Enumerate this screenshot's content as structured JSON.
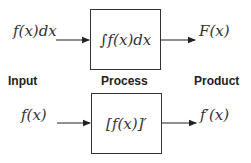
{
  "diagram": {
    "labels": {
      "input": "Input",
      "process": "Process",
      "product": "Product"
    },
    "rows": [
      {
        "input": "f(x)dx",
        "process": "∫f(x)dx",
        "product": "F(x)"
      },
      {
        "input": "f(x)",
        "process": "[f(x)]′",
        "product": "f′(x)"
      }
    ]
  }
}
